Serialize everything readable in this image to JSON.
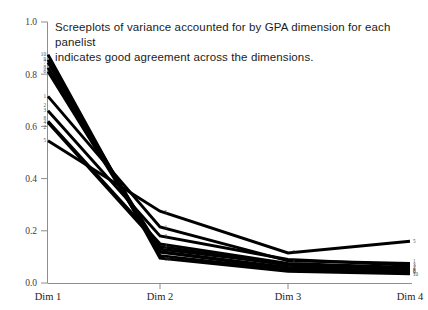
{
  "chart_data": {
    "type": "line",
    "title": "Screeplots of variance accounted for by GPA dimension for each panelist\nindicates good agreement across the dimensions.",
    "xlabel": "",
    "ylabel": "",
    "categories": [
      "Dim 1",
      "Dim 2",
      "Dim 3",
      "Dim 4"
    ],
    "ylim": [
      0.0,
      1.0
    ],
    "yticks": [
      "0.0",
      "0.2",
      "0.4",
      "0.6",
      "0.8",
      "1.0"
    ],
    "ytick_values": [
      0.0,
      0.2,
      0.4,
      0.6,
      0.8,
      1.0
    ],
    "grid": false,
    "legend": "none",
    "series": [
      {
        "name": "1",
        "values": [
          0.715,
          0.215,
          0.085,
          0.075
        ]
      },
      {
        "name": "2",
        "values": [
          0.62,
          0.15,
          0.075,
          0.06
        ]
      },
      {
        "name": "3",
        "values": [
          0.66,
          0.18,
          0.09,
          0.068
        ]
      },
      {
        "name": "4",
        "values": [
          0.615,
          0.14,
          0.068,
          0.052
        ]
      },
      {
        "name": "5",
        "values": [
          0.545,
          0.275,
          0.115,
          0.16
        ]
      },
      {
        "name": "6",
        "values": [
          0.81,
          0.118,
          0.055,
          0.04
        ]
      },
      {
        "name": "7",
        "values": [
          0.845,
          0.12,
          0.06,
          0.045
        ]
      },
      {
        "name": "8",
        "values": [
          0.825,
          0.13,
          0.072,
          0.05
        ]
      },
      {
        "name": "9",
        "values": [
          0.855,
          0.105,
          0.05,
          0.038
        ]
      },
      {
        "name": "10",
        "values": [
          0.875,
          0.095,
          0.045,
          0.035
        ]
      }
    ],
    "left_labels": [
      {
        "name": "10",
        "y": 0.875
      },
      {
        "name": "9",
        "y": 0.855
      },
      {
        "name": "7",
        "y": 0.845
      },
      {
        "name": "8",
        "y": 0.825
      },
      {
        "name": "6",
        "y": 0.81
      },
      {
        "name": "1",
        "y": 0.715
      },
      {
        "name": "2",
        "y": 0.68
      },
      {
        "name": "3",
        "y": 0.66
      },
      {
        "name": "8",
        "y": 0.63
      },
      {
        "name": "4",
        "y": 0.615
      },
      {
        "name": "2",
        "y": 0.598
      },
      {
        "name": "5",
        "y": 0.545
      }
    ],
    "mid_labels": [
      {
        "name": "5",
        "x": 1.02,
        "y": 0.272
      },
      {
        "name": "1",
        "x": 1.02,
        "y": 0.212
      },
      {
        "name": "3",
        "x": 1.02,
        "y": 0.178
      },
      {
        "name": "4",
        "x": 1.02,
        "y": 0.14
      },
      {
        "name": "10",
        "x": 1.02,
        "y": 0.09
      }
    ],
    "dim3_labels": [
      {
        "name": "5",
        "x": 2.02,
        "y": 0.118
      },
      {
        "name": "1",
        "x": 2.02,
        "y": 0.088
      }
    ],
    "right_labels": [
      {
        "name": "5",
        "y": 0.16
      },
      {
        "name": "1",
        "y": 0.082
      },
      {
        "name": "3",
        "y": 0.068
      },
      {
        "name": "2",
        "y": 0.059
      },
      {
        "name": "4",
        "y": 0.051
      },
      {
        "name": "8",
        "y": 0.046
      },
      {
        "name": "9",
        "y": 0.039
      },
      {
        "name": "10",
        "y": 0.033
      }
    ]
  },
  "colors": {
    "line": "#000000",
    "axis": "#8e8e8e",
    "text": "#1b1b1b",
    "background": "#ffffff"
  }
}
